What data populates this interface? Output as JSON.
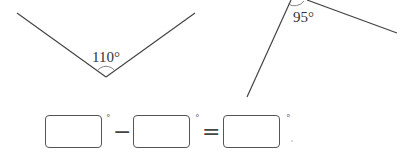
{
  "angles": [
    {
      "label": "110°",
      "value": 110
    },
    {
      "label": "95°",
      "value": 95
    }
  ],
  "equation": {
    "boxes": [
      "",
      "",
      ""
    ],
    "degree_symbol": "°",
    "operator_minus": "−",
    "operator_equals": "="
  },
  "colors": {
    "line": "#444444",
    "box_border": "#555555"
  }
}
